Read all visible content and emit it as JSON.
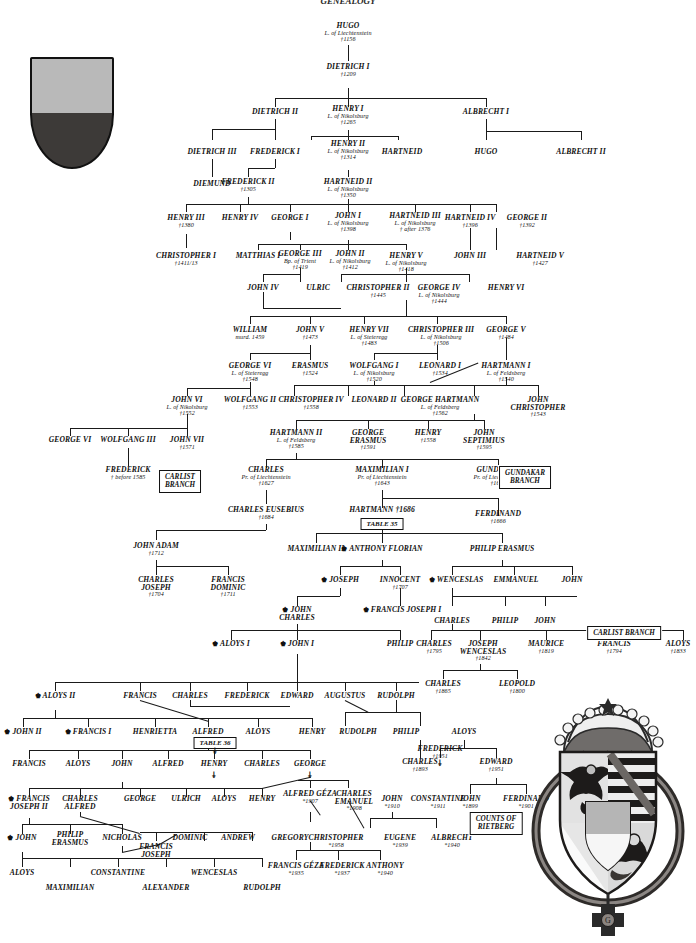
{
  "title": "GENEALOGY",
  "emblems": {
    "small_shield": {
      "name": "liechtenstein-shield",
      "top_color": "#b9b9b9",
      "bottom_color": "#3d3a38"
    },
    "great_arms": {
      "name": "princely-arms-of-liechtenstein",
      "crown": "princely-crown",
      "order": "golden-fleece-collar"
    }
  },
  "boxes": [
    {
      "id": "gundakar_branch",
      "lines": [
        "GUNDAKAR",
        "BRANCH"
      ]
    },
    {
      "id": "carlist_branch_1",
      "lines": [
        "CARLIST",
        "BRANCH"
      ]
    },
    {
      "id": "carlist_branch_2",
      "lines": [
        "CARLIST BRANCH"
      ]
    },
    {
      "id": "counts_rietberg",
      "lines": [
        "COUNTS OF",
        "RIETBERG"
      ]
    },
    {
      "id": "table35",
      "lines": [
        "TABLE 35"
      ]
    },
    {
      "id": "table36",
      "lines": [
        "TABLE 36"
      ]
    }
  ],
  "persons": [
    {
      "id": "p1",
      "name": "HUGO",
      "title": "L. of Liechtenstein",
      "date": "†1156"
    },
    {
      "id": "p2",
      "name": "DIETRICH I",
      "title": "",
      "date": "†1209"
    },
    {
      "id": "p3",
      "name": "DIETRICH II",
      "title": "",
      "date": ""
    },
    {
      "id": "p4",
      "name": "HENRY I",
      "title": "L. of Nikolsburg",
      "date": "†1265"
    },
    {
      "id": "p5",
      "name": "ALBRECHT I",
      "title": "",
      "date": ""
    },
    {
      "id": "p6",
      "name": "DIETRICH III",
      "title": "",
      "date": ""
    },
    {
      "id": "p7",
      "name": "FREDERICK I",
      "title": "",
      "date": ""
    },
    {
      "id": "p8",
      "name": "HENRY II",
      "title": "L. of Nikolsburg",
      "date": "†1314"
    },
    {
      "id": "p9",
      "name": "HARTNEID",
      "title": "",
      "date": ""
    },
    {
      "id": "p10",
      "name": "HUGO",
      "title": "",
      "date": ""
    },
    {
      "id": "p11",
      "name": "ALBRECHT II",
      "title": "",
      "date": ""
    },
    {
      "id": "p12",
      "name": "DIEMUND",
      "title": "",
      "date": ""
    },
    {
      "id": "p13",
      "name": "FREDERICK II",
      "title": "",
      "date": "†1305"
    },
    {
      "id": "p14",
      "name": "HARTNEID II",
      "title": "L. of Nikolsburg",
      "date": "†1350"
    },
    {
      "id": "p15",
      "name": "HENRY III",
      "title": "",
      "date": "†1380"
    },
    {
      "id": "p16",
      "name": "HENRY IV",
      "title": "",
      "date": ""
    },
    {
      "id": "p17",
      "name": "GEORGE I",
      "title": "",
      "date": ""
    },
    {
      "id": "p18",
      "name": "JOHN I",
      "title": "L. of Nikolsburg",
      "date": "†1398"
    },
    {
      "id": "p19",
      "name": "HARTNEID III",
      "title": "L. of Nikolsburg",
      "date": "† after 1376"
    },
    {
      "id": "p20",
      "name": "HARTNEID IV",
      "title": "",
      "date": "†1396"
    },
    {
      "id": "p21",
      "name": "GEORGE II",
      "title": "",
      "date": "†1392"
    },
    {
      "id": "p22",
      "name": "CHRISTOPHER I",
      "title": "",
      "date": "†1411/13"
    },
    {
      "id": "p23",
      "name": "MATTHIAS I",
      "title": "",
      "date": ""
    },
    {
      "id": "p24",
      "name": "GEORGE III",
      "title": "Bp. of Trient",
      "date": "†1419"
    },
    {
      "id": "p25",
      "name": "JOHN II",
      "title": "L. of Nikolsburg",
      "date": "†1412"
    },
    {
      "id": "p26",
      "name": "HENRY V",
      "title": "L. of Nikolsburg",
      "date": "†1418"
    },
    {
      "id": "p27",
      "name": "JOHN III",
      "title": "",
      "date": ""
    },
    {
      "id": "p28",
      "name": "HARTNEID V",
      "title": "",
      "date": "†1427"
    },
    {
      "id": "p29",
      "name": "JOHN IV",
      "title": "",
      "date": ""
    },
    {
      "id": "p30",
      "name": "ULRIC",
      "title": "",
      "date": ""
    },
    {
      "id": "p31",
      "name": "CHRISTOPHER II",
      "title": "",
      "date": "†1445"
    },
    {
      "id": "p32",
      "name": "GEORGE IV",
      "title": "L. of Nikolsburg",
      "date": "†1444"
    },
    {
      "id": "p33",
      "name": "HENRY VI",
      "title": "",
      "date": ""
    },
    {
      "id": "p34",
      "name": "WILLIAM",
      "title": "murd. 1459",
      "date": ""
    },
    {
      "id": "p35",
      "name": "JOHN V",
      "title": "",
      "date": "†1473"
    },
    {
      "id": "p36",
      "name": "HENRY VII",
      "title": "L. of Steieregg",
      "date": "†1483"
    },
    {
      "id": "p37",
      "name": "CHRISTOPHER III",
      "title": "L. of Nikolsburg",
      "date": "†1506"
    },
    {
      "id": "p38",
      "name": "GEORGE V",
      "title": "",
      "date": "†1484"
    },
    {
      "id": "p39",
      "name": "GEORGE VI",
      "title": "L. of Steieregg",
      "date": "†1548"
    },
    {
      "id": "p40",
      "name": "ERASMUS",
      "title": "",
      "date": "†1524"
    },
    {
      "id": "p41",
      "name": "WOLFGANG I",
      "title": "L. of Nikolsburg",
      "date": "†1520"
    },
    {
      "id": "p42",
      "name": "LEONARD I",
      "title": "",
      "date": "†1534"
    },
    {
      "id": "p43",
      "name": "HARTMANN I",
      "title": "L. of Feldsberg",
      "date": "†1540"
    },
    {
      "id": "p44",
      "name": "JOHN VI",
      "title": "L. of Nikolsburg",
      "date": "†1552"
    },
    {
      "id": "p45",
      "name": "WOLFGANG II",
      "title": "",
      "date": "†1553"
    },
    {
      "id": "p46",
      "name": "CHRISTOPHER IV",
      "title": "",
      "date": "†1558"
    },
    {
      "id": "p47",
      "name": "LEONARD II",
      "title": "",
      "date": ""
    },
    {
      "id": "p48",
      "name": "GEORGE HARTMANN",
      "title": "L. of Feldsberg",
      "date": "†1562"
    },
    {
      "id": "p49",
      "name": "JOHN CHRISTOPHER",
      "title": "",
      "date": "†1543"
    },
    {
      "id": "p50",
      "name": "GEORGE VI",
      "title": "",
      "date": ""
    },
    {
      "id": "p51",
      "name": "WOLFGANG III",
      "title": "",
      "date": ""
    },
    {
      "id": "p52",
      "name": "JOHN VII",
      "title": "",
      "date": "†1571"
    },
    {
      "id": "p53",
      "name": "HARTMANN II",
      "title": "L. of Feldsberg",
      "date": "†1585"
    },
    {
      "id": "p54",
      "name": "GEORGE ERASMUS",
      "title": "",
      "date": "†1591"
    },
    {
      "id": "p55",
      "name": "HENRY",
      "title": "",
      "date": "†1558"
    },
    {
      "id": "p56",
      "name": "JOHN SEPTIMIUS",
      "title": "",
      "date": "†1595"
    },
    {
      "id": "p57",
      "name": "FREDERICK",
      "title": "",
      "date": "† before 1585"
    },
    {
      "id": "p58",
      "name": "CHARLES",
      "title": "Pr. of Liechtenstein",
      "date": "†1627"
    },
    {
      "id": "p59",
      "name": "MAXIMILIAN I",
      "title": "Pr. of Liechtenstein",
      "date": "†1643"
    },
    {
      "id": "p60",
      "name": "GUNDAKAR",
      "title": "Pr. of Liechtenstein",
      "date": "†1658"
    },
    {
      "id": "p61",
      "name": "CHARLES EUSEBIUS",
      "title": "",
      "date": "†1684"
    },
    {
      "id": "p62",
      "name": "HARTMANN †1686",
      "title": "",
      "date": ""
    },
    {
      "id": "p63",
      "name": "FERDINAND",
      "title": "",
      "date": "†1666"
    },
    {
      "id": "p64",
      "name": "JOHN ADAM",
      "title": "",
      "date": "†1712"
    },
    {
      "id": "p65",
      "name": "MAXIMILIAN II",
      "title": "",
      "date": ""
    },
    {
      "id": "p66",
      "name": "ANTHONY FLORIAN",
      "title": "",
      "date": "",
      "crown": true
    },
    {
      "id": "p67",
      "name": "PHILIP ERASMUS",
      "title": "",
      "date": ""
    },
    {
      "id": "p68",
      "name": "CHARLES JOSEPH",
      "title": "",
      "date": "†1704"
    },
    {
      "id": "p69",
      "name": "FRANCIS DOMINIC",
      "title": "",
      "date": "†1711"
    },
    {
      "id": "p70",
      "name": "JOSEPH",
      "title": "",
      "date": "",
      "crown": true
    },
    {
      "id": "p71",
      "name": "INNOCENT",
      "title": "",
      "date": "†1707"
    },
    {
      "id": "p72",
      "name": "WENCESLAS",
      "title": "",
      "date": "",
      "crown": true
    },
    {
      "id": "p73",
      "name": "EMMANUEL",
      "title": "",
      "date": ""
    },
    {
      "id": "p74",
      "name": "JOHN",
      "title": "",
      "date": ""
    },
    {
      "id": "p75",
      "name": "JOHN CHARLES",
      "title": "",
      "date": "",
      "crown": true
    },
    {
      "id": "p76",
      "name": "FRANCIS JOSEPH I",
      "title": "",
      "date": "",
      "crown": true
    },
    {
      "id": "p77",
      "name": "CHARLES",
      "title": "",
      "date": ""
    },
    {
      "id": "p78",
      "name": "PHILIP",
      "title": "",
      "date": ""
    },
    {
      "id": "p79",
      "name": "JOHN",
      "title": "",
      "date": ""
    },
    {
      "id": "p80",
      "name": "ALOYS I",
      "title": "",
      "date": "",
      "crown": true
    },
    {
      "id": "p81",
      "name": "JOHN I",
      "title": "",
      "date": "",
      "crown": true
    },
    {
      "id": "p82",
      "name": "PHILIP",
      "title": "",
      "date": ""
    },
    {
      "id": "p83",
      "name": "CHARLES",
      "title": "",
      "date": "†1795"
    },
    {
      "id": "p84",
      "name": "JOSEPH WENCESLAS",
      "title": "",
      "date": "†1842"
    },
    {
      "id": "p85",
      "name": "MAURICE",
      "title": "",
      "date": "†1819"
    },
    {
      "id": "p86",
      "name": "FRANCIS",
      "title": "",
      "date": "†1794"
    },
    {
      "id": "p87",
      "name": "ALOYS",
      "title": "",
      "date": "†1833"
    },
    {
      "id": "p88",
      "name": "ALOYS II",
      "title": "",
      "date": "",
      "crown": true
    },
    {
      "id": "p89",
      "name": "FRANCIS",
      "title": "",
      "date": ""
    },
    {
      "id": "p90",
      "name": "CHARLES",
      "title": "",
      "date": ""
    },
    {
      "id": "p91",
      "name": "FREDERICK",
      "title": "",
      "date": ""
    },
    {
      "id": "p92",
      "name": "EDWARD",
      "title": "",
      "date": ""
    },
    {
      "id": "p93",
      "name": "AUGUSTUS",
      "title": "",
      "date": ""
    },
    {
      "id": "p94",
      "name": "RUDOLPH",
      "title": "",
      "date": ""
    },
    {
      "id": "p95",
      "name": "CHARLES",
      "title": "",
      "date": "†1865"
    },
    {
      "id": "p96",
      "name": "LEOPOLD",
      "title": "",
      "date": "†1800"
    },
    {
      "id": "p97",
      "name": "JOHN II",
      "title": "",
      "date": "",
      "crown": true
    },
    {
      "id": "p98",
      "name": "FRANCIS I",
      "title": "",
      "date": "",
      "crown": true
    },
    {
      "id": "p99",
      "name": "HENRIETTA",
      "title": "",
      "date": ""
    },
    {
      "id": "p100",
      "name": "ALFRED",
      "title": "",
      "date": ""
    },
    {
      "id": "p101",
      "name": "ALOYS",
      "title": "",
      "date": ""
    },
    {
      "id": "p102",
      "name": "HENRY",
      "title": "",
      "date": ""
    },
    {
      "id": "p103",
      "name": "RUDOLPH",
      "title": "",
      "date": ""
    },
    {
      "id": "p104",
      "name": "PHILIP",
      "title": "",
      "date": ""
    },
    {
      "id": "p105",
      "name": "ALOYS",
      "title": "",
      "date": ""
    },
    {
      "id": "p106",
      "name": "FRANCIS",
      "title": "",
      "date": ""
    },
    {
      "id": "p107",
      "name": "ALOYS",
      "title": "",
      "date": ""
    },
    {
      "id": "p108",
      "name": "JOHN",
      "title": "",
      "date": ""
    },
    {
      "id": "p109",
      "name": "ALFRED",
      "title": "",
      "date": ""
    },
    {
      "id": "p110",
      "name": "HENRY",
      "title": "",
      "date": ""
    },
    {
      "id": "p111",
      "name": "CHARLES",
      "title": "",
      "date": ""
    },
    {
      "id": "p112",
      "name": "GEORGE",
      "title": "",
      "date": ""
    },
    {
      "id": "p113",
      "name": "CHARLES",
      "title": "",
      "date": "†1893"
    },
    {
      "id": "p114",
      "name": "FREDERICK",
      "title": "",
      "date": "†1951"
    },
    {
      "id": "p115",
      "name": "EDWARD",
      "title": "",
      "date": "†1951"
    },
    {
      "id": "p116",
      "name": "FRANCIS JOSEPH II",
      "title": "",
      "date": "",
      "crown": true
    },
    {
      "id": "p117",
      "name": "CHARLES ALFRED",
      "title": "",
      "date": ""
    },
    {
      "id": "p118",
      "name": "GEORGE",
      "title": "",
      "date": ""
    },
    {
      "id": "p119",
      "name": "ULRICH",
      "title": "",
      "date": ""
    },
    {
      "id": "p120",
      "name": "ALOYS",
      "title": "",
      "date": ""
    },
    {
      "id": "p121",
      "name": "HENRY",
      "title": "",
      "date": ""
    },
    {
      "id": "p122",
      "name": "ALFRED GÉZA",
      "title": "",
      "date": "*1907"
    },
    {
      "id": "p123",
      "name": "CHARLES EMANUEL",
      "title": "",
      "date": "*1908"
    },
    {
      "id": "p124",
      "name": "JOHN",
      "title": "",
      "date": "*1910"
    },
    {
      "id": "p125",
      "name": "CONSTANTINE",
      "title": "",
      "date": "*1911"
    },
    {
      "id": "p126",
      "name": "JOHN",
      "title": "",
      "date": "*1899"
    },
    {
      "id": "p127",
      "name": "FERDINAND",
      "title": "",
      "date": "*1901"
    },
    {
      "id": "p128",
      "name": "JOHN",
      "title": "",
      "date": "",
      "crown": true
    },
    {
      "id": "p129",
      "name": "PHILIP ERASMUS",
      "title": "",
      "date": ""
    },
    {
      "id": "p130",
      "name": "NICHOLAS",
      "title": "",
      "date": ""
    },
    {
      "id": "p131",
      "name": "FRANCIS JOSEPH",
      "title": "",
      "date": ""
    },
    {
      "id": "p132",
      "name": "DOMINIC",
      "title": "",
      "date": ""
    },
    {
      "id": "p133",
      "name": "ANDREW",
      "title": "",
      "date": ""
    },
    {
      "id": "p134",
      "name": "GREGORY",
      "title": "",
      "date": ""
    },
    {
      "id": "p135",
      "name": "CHRISTOPHER",
      "title": "",
      "date": "*1958"
    },
    {
      "id": "p136",
      "name": "EUGENE",
      "title": "",
      "date": "*1939"
    },
    {
      "id": "p137",
      "name": "ALBRECHT",
      "title": "",
      "date": "*1940"
    },
    {
      "id": "p138",
      "name": "ALOYS",
      "title": "",
      "date": ""
    },
    {
      "id": "p139",
      "name": "CONSTANTINE",
      "title": "",
      "date": ""
    },
    {
      "id": "p140",
      "name": "WENCESLAS",
      "title": "",
      "date": ""
    },
    {
      "id": "p141",
      "name": "MAXIMILIAN",
      "title": "",
      "date": ""
    },
    {
      "id": "p142",
      "name": "ALEXANDER",
      "title": "",
      "date": ""
    },
    {
      "id": "p143",
      "name": "RUDOLPH",
      "title": "",
      "date": ""
    },
    {
      "id": "p144",
      "name": "FRANCIS GÉZA",
      "title": "",
      "date": "*1935"
    },
    {
      "id": "p145",
      "name": "FREDERICK",
      "title": "",
      "date": "*1937"
    },
    {
      "id": "p146",
      "name": "ANTHONY",
      "title": "",
      "date": "*1940"
    }
  ]
}
